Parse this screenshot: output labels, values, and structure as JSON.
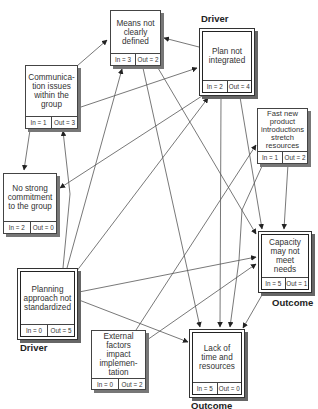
{
  "diagram": {
    "type": "interrelationship-digraph",
    "nodes": [
      {
        "id": "means",
        "label": "Means not clearly defined",
        "lines": [
          "Means not",
          "clearly",
          "defined"
        ],
        "in": "In = 3",
        "out": "Out = 2",
        "role": ""
      },
      {
        "id": "plan",
        "label": "Plan not integrated",
        "lines": [
          "Plan not",
          "integrated"
        ],
        "in": "In = 2",
        "out": "Out = 4",
        "role": "Driver"
      },
      {
        "id": "comm",
        "label": "Communication issues within the group",
        "lines": [
          "Communica-",
          "tion issues",
          "within the",
          "group"
        ],
        "in": "In = 1",
        "out": "Out = 3",
        "role": ""
      },
      {
        "id": "fast",
        "label": "Fast new product introductions stretch resources",
        "lines": [
          "Fast new",
          "product",
          "introductions",
          "stretch",
          "resources"
        ],
        "in": "In = 1",
        "out": "Out = 2",
        "role": ""
      },
      {
        "id": "commit",
        "label": "No strong commitment to the group",
        "lines": [
          "No strong",
          "commitment",
          "to the group"
        ],
        "in": "In = 2",
        "out": "Out = 0",
        "role": ""
      },
      {
        "id": "capacity",
        "label": "Capacity may not meet needs",
        "lines": [
          "Capacity",
          "may not",
          "meet needs"
        ],
        "in": "In = 5",
        "out": "Out = 1",
        "role": "Outcome"
      },
      {
        "id": "planning",
        "label": "Planning approach not standardized",
        "lines": [
          "Planning",
          "approach not",
          "standardized"
        ],
        "in": "In = 0",
        "out": "Out = 5",
        "role": "Driver"
      },
      {
        "id": "external",
        "label": "External factors impact implementation",
        "lines": [
          "External",
          "factors impact",
          "implemen-",
          "tation"
        ],
        "in": "In = 0",
        "out": "Out = 2",
        "role": ""
      },
      {
        "id": "lack",
        "label": "Lack of time and resources",
        "lines": [
          "Lack of",
          "time and",
          "resources"
        ],
        "in": "In = 5",
        "out": "Out = 0",
        "role": "Outcome"
      }
    ],
    "edges": [
      {
        "from": "comm",
        "to": "means"
      },
      {
        "from": "comm",
        "to": "plan"
      },
      {
        "from": "comm",
        "to": "commit"
      },
      {
        "from": "plan",
        "to": "means"
      },
      {
        "from": "plan",
        "to": "commit"
      },
      {
        "from": "plan",
        "to": "capacity"
      },
      {
        "from": "plan",
        "to": "lack"
      },
      {
        "from": "means",
        "to": "capacity"
      },
      {
        "from": "means",
        "to": "lack"
      },
      {
        "from": "planning",
        "to": "comm"
      },
      {
        "from": "planning",
        "to": "means"
      },
      {
        "from": "planning",
        "to": "plan"
      },
      {
        "from": "planning",
        "to": "capacity"
      },
      {
        "from": "planning",
        "to": "lack"
      },
      {
        "from": "fast",
        "to": "capacity"
      },
      {
        "from": "fast",
        "to": "lack"
      },
      {
        "from": "external",
        "to": "fast"
      },
      {
        "from": "external",
        "to": "capacity"
      },
      {
        "from": "capacity",
        "to": "lack"
      }
    ],
    "role_labels": {
      "driver": "Driver",
      "outcome": "Outcome"
    }
  }
}
